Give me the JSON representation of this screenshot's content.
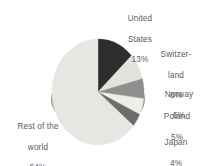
{
  "chart_data": {
    "type": "pie",
    "title": "",
    "subtitle": "",
    "xlabel": "",
    "ylabel": "",
    "legend_position": "none",
    "grid": false,
    "labels_outside": true,
    "start_angle_deg": 0,
    "direction": "clockwise",
    "three_d": true,
    "categories": [
      "United States",
      "Switzerland",
      "Norway",
      "Poland",
      "Japan",
      "Rest of the world"
    ],
    "values": [
      13,
      8,
      6,
      5,
      4,
      64
    ],
    "value_suffix": "%",
    "slice_colors": [
      "#2e2e2e",
      "#e2e2de",
      "#8e8f8c",
      "#ededea",
      "#6d6e6b",
      "#e6e6e2"
    ],
    "slices": [
      {
        "name": "United States",
        "value": 13,
        "display": "13%",
        "color": "#2e2e2e"
      },
      {
        "name": "Switzerland",
        "value": 8,
        "display": "8%",
        "color": "#e2e2de"
      },
      {
        "name": "Norway",
        "value": 6,
        "display": "6%",
        "color": "#8e8f8c"
      },
      {
        "name": "Poland",
        "value": 5,
        "display": "5%",
        "color": "#ededea"
      },
      {
        "name": "Japan",
        "value": 4,
        "display": "4%",
        "color": "#6d6e6b"
      },
      {
        "name": "Rest of the world",
        "value": 64,
        "display": "64%",
        "color": "#e6e6e2"
      }
    ]
  },
  "labels": {
    "united_states": {
      "line1": "United",
      "line2": "States",
      "value": "13%"
    },
    "switzerland": {
      "line1": "Switzer-",
      "line2": "land",
      "value": "8%"
    },
    "norway": {
      "line1": "Norway",
      "line2": "",
      "value": "6%"
    },
    "poland": {
      "line1": "Poland",
      "line2": "",
      "value": "5%"
    },
    "japan": {
      "line1": "Japan",
      "line2": "",
      "value": "4%"
    },
    "rest_world": {
      "line1": "Rest of the",
      "line2": "world",
      "value": "64%"
    }
  },
  "colors": {
    "background": "#ffffff",
    "text": "#5a5b5e",
    "pie_edge": "#b8b8b4",
    "depth_shadow": "#9a9a96"
  }
}
